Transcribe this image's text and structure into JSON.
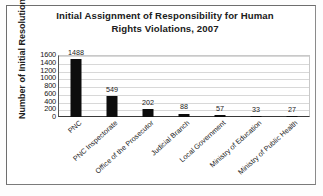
{
  "chart_data": {
    "type": "bar",
    "title": "Initial Assignment of Responsibility for Human Rights Violations, 2007",
    "title_line1": "Initial Assignment of Responsibility for Human",
    "title_line2": "Rights Violations, 2007",
    "xlabel": "",
    "ylabel": "Number of Initial Resolutions",
    "categories": [
      "PNC",
      "PNC Inspectorate",
      "Office of the Prosecutor",
      "Judicial Branch",
      "Local Government",
      "Ministry of Education",
      "Ministry of Public Health"
    ],
    "values": [
      1488,
      549,
      202,
      88,
      57,
      33,
      27
    ],
    "ylim": [
      0,
      1600
    ],
    "yticks": [
      1600,
      1400,
      1200,
      1000,
      800,
      600,
      400,
      200,
      0
    ],
    "grid": true,
    "legend": "none",
    "bar_color": "#0d0d0d"
  }
}
